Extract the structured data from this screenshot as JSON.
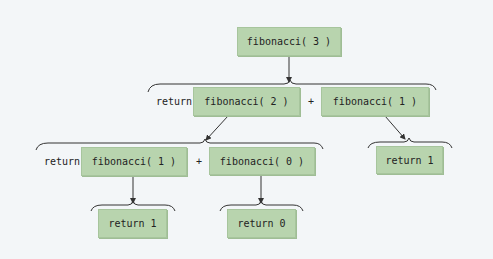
{
  "diagram": {
    "nodes": {
      "root": "fibonacci( 3 )",
      "l1_left": "fibonacci( 2 )",
      "l1_right": "fibonacci( 1 )",
      "l2_left": "fibonacci( 1 )",
      "l2_right": "fibonacci( 0 )",
      "l2_far_right": "return 1",
      "l3_left": "return 1",
      "l3_right": "return 0"
    },
    "labels": {
      "return_l1": "return",
      "plus_l1": "+",
      "return_l2": "return",
      "plus_l2": "+"
    },
    "colors": {
      "box": "#b8d4ae",
      "background": "#f3f6f8",
      "line": "#333333"
    }
  }
}
